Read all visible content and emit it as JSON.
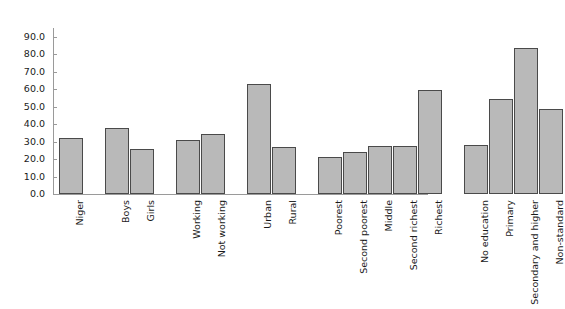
{
  "chart_data": {
    "type": "bar",
    "title": "",
    "subtitle": "",
    "xlabel": "",
    "ylabel": "",
    "ylim": [
      0,
      95
    ],
    "grid": false,
    "legend": "none",
    "orientation": "vertical",
    "bar_color": "#b9b9b9",
    "bar_edge_color": "#4a4a4a",
    "axis_color": "#9a9a9a",
    "text_color": "#1a1a1a",
    "ytick_labels": [
      "0.0",
      "10.0",
      "20.0",
      "30.0",
      "40.0",
      "50.0",
      "60.0",
      "70.0",
      "80.0",
      "90.0"
    ],
    "ytick_values": [
      0,
      10,
      20,
      30,
      40,
      50,
      60,
      70,
      80,
      90
    ],
    "categories": [
      "Niger",
      "Boys",
      "Girls",
      "Working",
      "Not working",
      "Urban",
      "Rural",
      "Poorest",
      "Second poorest",
      "Middle",
      "Second richest",
      "Richest",
      "No education",
      "Primary",
      "Secondary and higher",
      "Non-standard"
    ],
    "values": [
      32.0,
      38.0,
      25.5,
      31.0,
      34.5,
      63.0,
      27.0,
      21.0,
      24.0,
      27.5,
      27.5,
      59.5,
      28.0,
      54.5,
      83.5,
      48.5
    ],
    "groups": [
      {
        "name": "Total",
        "categories": [
          "Niger"
        ]
      },
      {
        "name": "Sex",
        "categories": [
          "Boys",
          "Girls"
        ]
      },
      {
        "name": "Work status",
        "categories": [
          "Working",
          "Not working"
        ]
      },
      {
        "name": "Residence",
        "categories": [
          "Urban",
          "Rural"
        ]
      },
      {
        "name": "Wealth quintile",
        "categories": [
          "Poorest",
          "Second poorest",
          "Middle",
          "Second richest",
          "Richest"
        ]
      },
      {
        "name": "Education",
        "categories": [
          "No education",
          "Primary",
          "Secondary and higher",
          "Non-standard"
        ]
      }
    ],
    "bar_layout_px": [
      {
        "label": "Niger",
        "value": 32.0,
        "left": 6,
        "width": 25
      },
      {
        "label": "Boys",
        "value": 38.0,
        "left": 52,
        "width": 25
      },
      {
        "label": "Girls",
        "value": 25.5,
        "left": 77,
        "width": 25
      },
      {
        "label": "Working",
        "value": 31.0,
        "left": 123,
        "width": 25
      },
      {
        "label": "Not working",
        "value": 34.5,
        "left": 148,
        "width": 25
      },
      {
        "label": "Urban",
        "value": 63.0,
        "left": 194,
        "width": 25
      },
      {
        "label": "Rural",
        "value": 27.0,
        "left": 219,
        "width": 25
      },
      {
        "label": "Poorest",
        "value": 21.0,
        "left": 259,
        "width": 22
      },
      {
        "label": "Second poorest",
        "value": 24.0,
        "left": 281,
        "width": 22
      },
      {
        "label": "Middle",
        "value": 27.5,
        "left": 303,
        "width": 22
      },
      {
        "label": "Second richest",
        "value": 27.5,
        "left": 325,
        "width": 22
      },
      {
        "label": "Richest",
        "value": 59.5,
        "left": 347,
        "width": 22
      },
      {
        "label": "No education",
        "value": 28.0,
        "left": 0,
        "width": 0
      },
      {
        "label": "Primary",
        "value": 54.5,
        "left": 0,
        "width": 0
      },
      {
        "label": "Secondary and higher",
        "value": 83.5,
        "left": 0,
        "width": 0
      },
      {
        "label": "Non-standard",
        "value": 48.5,
        "left": 0,
        "width": 0
      }
    ]
  }
}
